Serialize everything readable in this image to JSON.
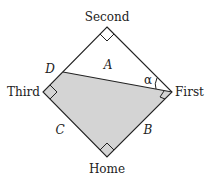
{
  "diagram": {
    "bases": {
      "second": "Second",
      "third": "Third",
      "first": "First",
      "home": "Home"
    },
    "region_labels": {
      "A": "A",
      "B": "B",
      "C": "C",
      "D": "D",
      "alpha": "α"
    },
    "colors": {
      "line": "#222222",
      "shaded_fill": "#d4d4d4",
      "background": "#ffffff"
    }
  }
}
